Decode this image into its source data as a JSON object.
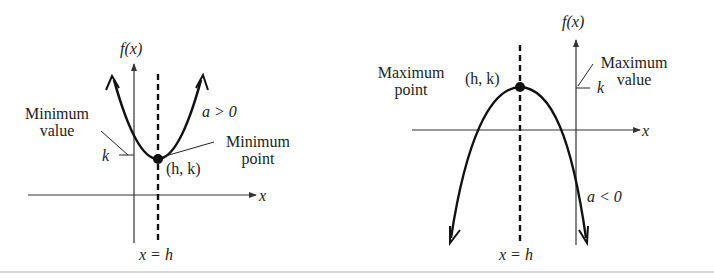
{
  "diagram": {
    "type": "parabola-vertex-comparison",
    "colors": {
      "curve": "#111111",
      "axis": "#333333",
      "text": "#222222"
    },
    "left_graph": {
      "y_axis_label": "f(x)",
      "x_axis_label": "x",
      "opening": "up",
      "condition_label": "a > 0",
      "vertex_label": "(h, k)",
      "vertex_callout": [
        "Minimum",
        "point"
      ],
      "value_callout": [
        "Minimum",
        "value"
      ],
      "k_label": "k",
      "axis_of_symmetry_label": "x = h"
    },
    "right_graph": {
      "y_axis_label": "f(x)",
      "x_axis_label": "x",
      "opening": "down",
      "condition_label": "a < 0",
      "vertex_label": "(h, k)",
      "vertex_callout": [
        "Maximum",
        "point"
      ],
      "value_callout": [
        "Maximum",
        "value"
      ],
      "k_label": "k",
      "axis_of_symmetry_label": "x = h"
    }
  }
}
